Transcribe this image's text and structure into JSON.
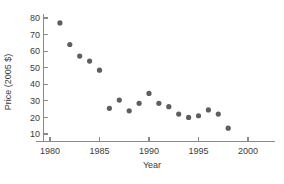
{
  "chart_data": {
    "type": "scatter",
    "title": "",
    "subtitle": "",
    "xlabel": "Year",
    "ylabel": "Price (2005 $)",
    "xlim": [
      1980,
      2000
    ],
    "ylim": [
      5,
      82
    ],
    "grid": false,
    "legend": null,
    "marker": {
      "shape": "circle",
      "color": "#5e5e5e",
      "radius_px": 2.6
    },
    "x_ticks": [
      1980,
      1985,
      1990,
      1995,
      2000
    ],
    "x_tick_labels": [
      "1980",
      "1985",
      "1990",
      "1995",
      "2000"
    ],
    "y_ticks": [
      10,
      20,
      30,
      40,
      50,
      60,
      70,
      80
    ],
    "y_tick_labels": [
      "10",
      "20",
      "30",
      "40",
      "50",
      "60",
      "70",
      "80"
    ],
    "x": [
      1981,
      1982,
      1983,
      1984,
      1985,
      1986,
      1987,
      1988,
      1989,
      1990,
      1991,
      1992,
      1993,
      1994,
      1995,
      1996,
      1997,
      1998
    ],
    "values": [
      77,
      64,
      57,
      54,
      48.5,
      25.5,
      30.5,
      24,
      28.5,
      34.5,
      28.5,
      26.5,
      22,
      20,
      21,
      24.5,
      22,
      13.5
    ],
    "series": [
      {
        "name": "Price (2005 $)",
        "x": [
          1981,
          1982,
          1983,
          1984,
          1985,
          1986,
          1987,
          1988,
          1989,
          1990,
          1991,
          1992,
          1993,
          1994,
          1995,
          1996,
          1997,
          1998
        ],
        "values": [
          77,
          64,
          57,
          54,
          48.5,
          25.5,
          30.5,
          24,
          28.5,
          34.5,
          28.5,
          26.5,
          22,
          20,
          21,
          24.5,
          22,
          13.5
        ]
      }
    ]
  },
  "axes": {
    "y_axis_title": "Price (2005 $)",
    "x_axis_title": "Year"
  }
}
